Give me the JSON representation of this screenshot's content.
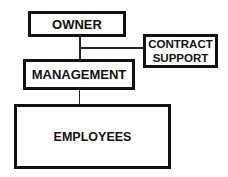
{
  "diagram": {
    "type": "organization-chart",
    "nodes": {
      "owner": {
        "label": "OWNER"
      },
      "contract_support": {
        "line1": "CONTRACT",
        "line2": "SUPPORT"
      },
      "management": {
        "label": "MANAGEMENT"
      },
      "employees": {
        "label": "EMPLOYEES"
      }
    },
    "edges": [
      {
        "from": "OWNER",
        "to": "MANAGEMENT"
      },
      {
        "from": "OWNER-MANAGEMENT link",
        "to": "CONTRACT SUPPORT"
      },
      {
        "from": "MANAGEMENT",
        "to": "EMPLOYEES"
      }
    ]
  }
}
